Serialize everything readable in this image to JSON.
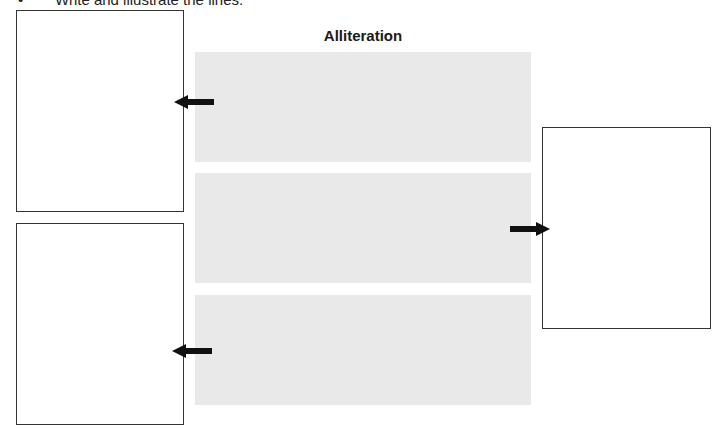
{
  "instruction": {
    "bullet": "•",
    "text": "Write and illustrate the lines."
  },
  "worksheet": {
    "title": "Alliteration",
    "colors": {
      "line_box": "#e9e9e9",
      "frame_border": "#333333",
      "arrow": "#111111"
    },
    "line_boxes": [
      {
        "id": 1,
        "text": ""
      },
      {
        "id": 2,
        "text": ""
      },
      {
        "id": 3,
        "text": ""
      }
    ],
    "illustration_frames": [
      {
        "id": "left-top",
        "points_to_line": 1
      },
      {
        "id": "right",
        "points_to_line": 2
      },
      {
        "id": "left-bottom",
        "points_to_line": 3
      }
    ]
  }
}
